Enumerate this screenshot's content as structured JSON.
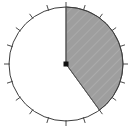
{
  "figure": {
    "background_color": "#ffffff",
    "width": 136,
    "height": 132
  },
  "chart_data": {
    "type": "pie",
    "title": "",
    "subtitle": "",
    "xlabel": "",
    "ylabel": "",
    "legend_position": "none",
    "grid": false,
    "categories": [
      "Shaded sector",
      "Unshaded remainder"
    ],
    "values": [
      40,
      60
    ],
    "units": "percent",
    "angles_deg": [
      144,
      216
    ],
    "start_angle_deg": 0,
    "direction": "clockwise",
    "slice_colors": [
      "#9e9e9e",
      "#ffffff"
    ],
    "slice_hatched": [
      true,
      false
    ],
    "labels": [],
    "annotations": []
  },
  "geometry": {
    "center_x": 66,
    "center_y": 64,
    "radius": 57,
    "outline_color": "#3c3c3c",
    "outline_width": 1,
    "center_dot_color": "#111111",
    "center_dot_size": 5,
    "radius_line_color": "#555555",
    "radius_line_width": 1
  },
  "ticks": {
    "count": 20,
    "step_deg": 18,
    "start_deg": 0,
    "length": 6,
    "color": "#4a4a4a",
    "width": 1,
    "labels": []
  },
  "hatch": {
    "pattern": "diagonal-lines",
    "angle_deg": 45,
    "spacing": 7,
    "line_color": "#b8b8b8",
    "line_width": 1,
    "fill_color": "#9e9e9e"
  },
  "icons": {
    "center_point": "center-dot-icon",
    "sector": "pie-sector-icon"
  }
}
